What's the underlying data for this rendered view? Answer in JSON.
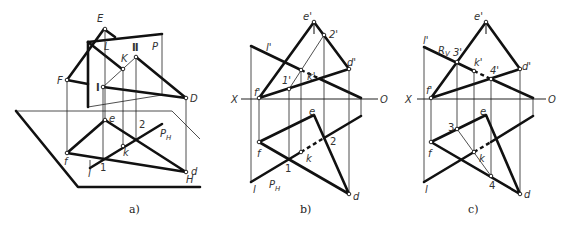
{
  "figure": {
    "panels": [
      {
        "id": "a",
        "caption": "a)",
        "labels": {
          "E": "E",
          "L": "L",
          "II": "Ⅱ",
          "P": "P",
          "K": "K",
          "F": "F",
          "I": "Ⅰ",
          "D": "D",
          "e": "e",
          "f": "f",
          "two": "2",
          "PH": "P",
          "PH_sub": "H",
          "k": "k",
          "l": "l",
          "one": "1",
          "d": "d",
          "H": "H"
        }
      },
      {
        "id": "b",
        "caption": "b)",
        "labels": {
          "e_p": "e'",
          "two_p": "2'",
          "l_p": "l'",
          "k_p": "k'",
          "one_p": "1'",
          "d_p": "d'",
          "f_p": "f'",
          "X": "X",
          "O": "O",
          "e": "e",
          "f": "f",
          "k": "k",
          "two": "2",
          "one": "1",
          "l": "l",
          "PH": "P",
          "PH_sub": "H",
          "d": "d"
        }
      },
      {
        "id": "c",
        "caption": "c)",
        "labels": {
          "e_p": "e'",
          "l_p": "l'",
          "RV": "R",
          "RV_sub": "V",
          "three_p": "3'",
          "k_p": "k'",
          "four_p": "4'",
          "d_p": "d'",
          "f_p": "f'",
          "X": "X",
          "O": "O",
          "e": "e",
          "three": "3",
          "f": "f",
          "k": "k",
          "four": "4",
          "l": "l",
          "d": "d"
        }
      }
    ]
  }
}
